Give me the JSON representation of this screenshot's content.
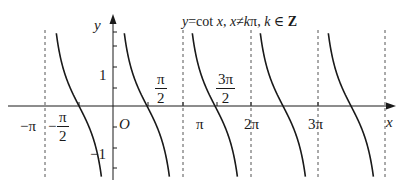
{
  "title": {
    "lhs": "y",
    "eq": "=cot ",
    "x": "x",
    "cond1": ", ",
    "cond_x": "x",
    "neq": "≠",
    "cond_k": "k",
    "pi": "π",
    "sep": ", ",
    "k": "k",
    "in": " ∈ ",
    "Z": "Z"
  },
  "axes": {
    "x_label": "x",
    "y_label": "y",
    "origin_label": "O"
  },
  "x_ticks": {
    "neg_pi": "−π",
    "neg_half_pi_sign": "−",
    "neg_half_pi_num": "π",
    "neg_half_pi_den": "2",
    "half_pi_num": "π",
    "half_pi_den": "2",
    "pi": "π",
    "three_half_pi_num": "3π",
    "three_half_pi_den": "2",
    "two_pi": "2π",
    "three_pi": "3π"
  },
  "y_ticks": {
    "one": "1",
    "neg_one": "−1"
  },
  "colors": {
    "curve": "#1a1a1a",
    "axis": "#1a1a1a",
    "asymptote": "#555555"
  },
  "chart_data": {
    "type": "line",
    "xlabel": "x",
    "ylabel": "y",
    "function": "cot(x)",
    "x_tick_labels": [
      "−π",
      "−π/2",
      "O",
      "π/2",
      "π",
      "3π/2",
      "2π",
      "3π"
    ],
    "y_tick_labels": [
      "1",
      "−1"
    ],
    "asymptotes": [
      "−π",
      "0",
      "π",
      "2π",
      "3π",
      "4π"
    ],
    "branches": [
      {
        "from": "−π",
        "to": "0"
      },
      {
        "from": "0",
        "to": "π"
      },
      {
        "from": "π",
        "to": "2π"
      },
      {
        "from": "2π",
        "to": "3π"
      },
      {
        "from": "3π",
        "to": "4π"
      }
    ],
    "ylim": [
      -1.5,
      1.5
    ],
    "grid": false
  }
}
